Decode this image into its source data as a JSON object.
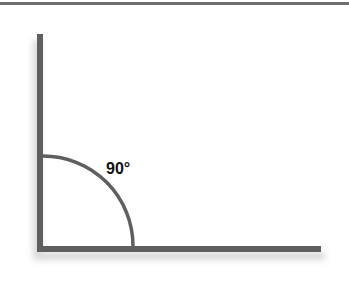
{
  "diagram": {
    "angle_label": "90°",
    "colors": {
      "line": "#5f5f5f",
      "rule": "#6e6e6e",
      "shadow": "#cfcfcf",
      "text": "#111111"
    }
  }
}
